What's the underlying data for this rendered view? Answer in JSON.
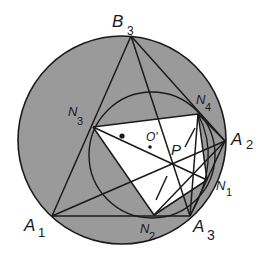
{
  "diagram": {
    "type": "geometry-construction",
    "colors": {
      "background": "#ffffff",
      "disk_fill": "#9a9a9a",
      "polygon_fill": "#ffffff",
      "stroke": "#1a1a1a"
    },
    "outer_circle": {
      "cx": 122,
      "cy": 140,
      "r": 104
    },
    "inner_circle": {
      "cx": 152,
      "cy": 155,
      "r": 63
    },
    "points": {
      "B3": {
        "x": 131,
        "y": 36
      },
      "N3": {
        "x": 93,
        "y": 127
      },
      "N4": {
        "x": 198,
        "y": 114
      },
      "A2": {
        "x": 225,
        "y": 141
      },
      "N1": {
        "x": 207,
        "y": 180
      },
      "A3": {
        "x": 190,
        "y": 216
      },
      "N2": {
        "x": 154,
        "y": 215
      },
      "A1": {
        "x": 52,
        "y": 216
      },
      "P": {
        "x": 175,
        "y": 162
      },
      "O_prime": {
        "x": 150,
        "y": 147
      },
      "dot": {
        "x": 122,
        "y": 136
      }
    },
    "labels": {
      "B3": {
        "main": "B",
        "sub": "3"
      },
      "N3": {
        "main": "N",
        "sub": "3"
      },
      "N4": {
        "main": "N",
        "sub": "4"
      },
      "A2": {
        "main": "A",
        "sub": "2"
      },
      "N1": {
        "main": "N",
        "sub": "1"
      },
      "A3": {
        "main": "A",
        "sub": "3"
      },
      "N2": {
        "main": "N",
        "sub": "2"
      },
      "A1": {
        "main": "A",
        "sub": "1"
      },
      "P": {
        "main": "P"
      },
      "O_prime": {
        "main": "O'"
      }
    }
  }
}
